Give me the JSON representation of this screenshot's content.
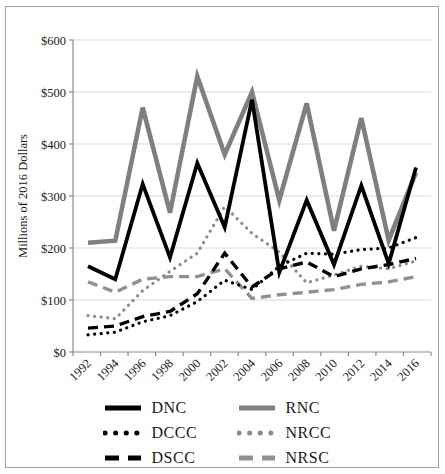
{
  "figure": {
    "background": "#ffffff",
    "border_color": "#a3a3a3",
    "text_color": "#1a1a1a",
    "axis_color": "#8c8c8c",
    "gridline_color": "#d9d9d9"
  },
  "chart_data": {
    "type": "line",
    "title": "",
    "xlabel": "",
    "ylabel": "Millions of 2016 Dollars",
    "ylim": [
      0,
      600
    ],
    "ytick_step": 100,
    "ytick_prefix": "$",
    "grid": "horizontal-only",
    "legend_position": "bottom-two-columns",
    "x_labels": [
      "1992",
      "1994",
      "1996",
      "1998",
      "2000",
      "2002",
      "2004",
      "2006",
      "2008",
      "2010",
      "2012",
      "2014",
      "2016"
    ],
    "series": [
      {
        "name": "DNC",
        "color": "#000000",
        "style": "solid",
        "width": 3.8,
        "values": [
          165,
          140,
          323,
          182,
          363,
          240,
          485,
          153,
          292,
          168,
          320,
          170,
          355
        ]
      },
      {
        "name": "RNC",
        "color": "#7f7f7f",
        "style": "solid",
        "width": 4.6,
        "values": [
          210,
          214,
          470,
          268,
          530,
          380,
          500,
          292,
          478,
          233,
          450,
          215,
          345
        ]
      },
      {
        "name": "DCCC",
        "color": "#000000",
        "style": "dotted",
        "width": 3.2,
        "values": [
          33,
          38,
          58,
          70,
          97,
          138,
          120,
          165,
          190,
          188,
          197,
          200,
          220
        ]
      },
      {
        "name": "NRCC",
        "color": "#8c8c8c",
        "style": "dotted",
        "width": 3.2,
        "values": [
          70,
          64,
          118,
          155,
          190,
          280,
          228,
          192,
          133,
          148,
          165,
          160,
          175
        ]
      },
      {
        "name": "DSCC",
        "color": "#000000",
        "style": "dashed",
        "width": 3.4,
        "values": [
          46,
          50,
          68,
          78,
          112,
          190,
          125,
          160,
          173,
          145,
          160,
          168,
          180
        ]
      },
      {
        "name": "NRSC",
        "color": "#919191",
        "style": "dashed",
        "width": 3.4,
        "values": [
          135,
          115,
          140,
          145,
          145,
          160,
          103,
          110,
          115,
          120,
          130,
          135,
          145
        ]
      }
    ]
  }
}
